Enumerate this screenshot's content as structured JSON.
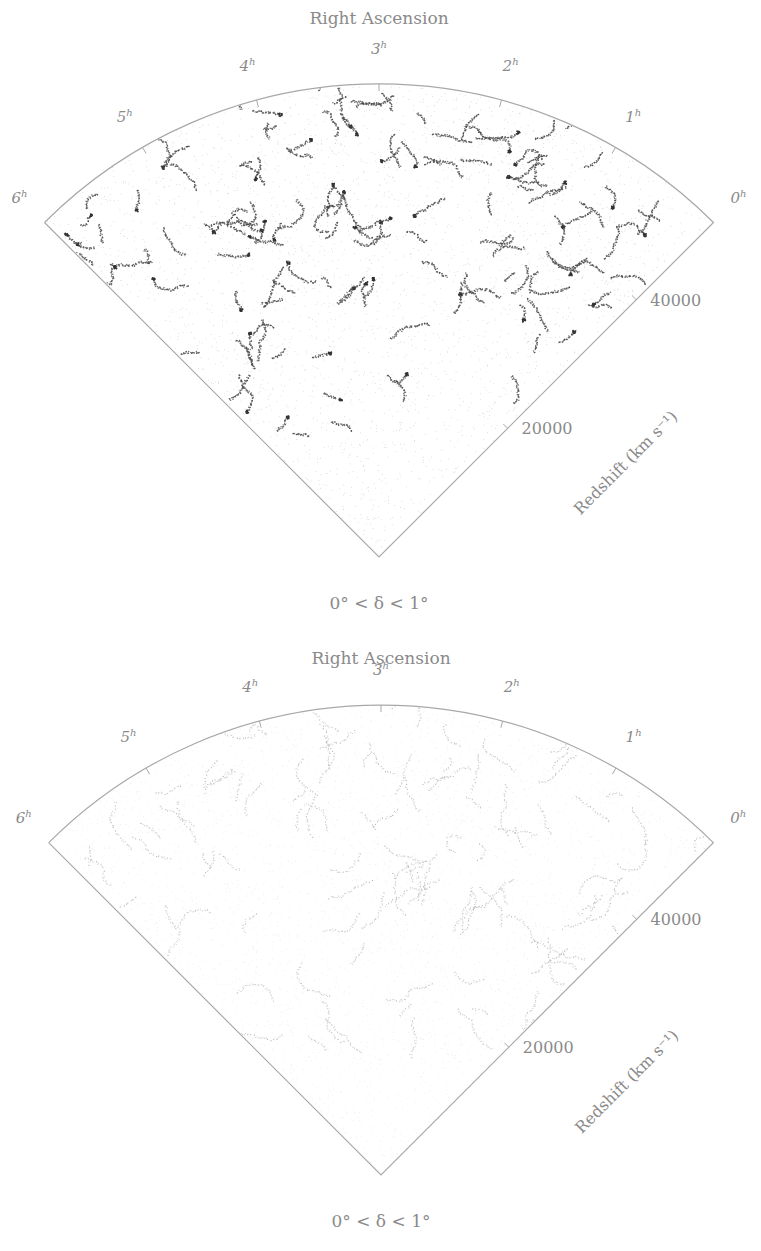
{
  "chart_data": [
    {
      "type": "scatter",
      "subtype": "wedge-diagram",
      "title": "Right Ascension",
      "ra_tick_labels": [
        "0h",
        "1h",
        "2h",
        "3h",
        "4h",
        "5h",
        "6h"
      ],
      "ra_ticks": [
        {
          "value": 0,
          "hour": "0",
          "sup": "h"
        },
        {
          "value": 1,
          "hour": "1",
          "sup": "h"
        },
        {
          "value": 2,
          "hour": "2",
          "sup": "h"
        },
        {
          "value": 3,
          "hour": "3",
          "sup": "h"
        },
        {
          "value": 4,
          "hour": "4",
          "sup": "h"
        },
        {
          "value": 5,
          "hour": "5",
          "sup": "h"
        },
        {
          "value": 6,
          "hour": "6",
          "sup": "h"
        }
      ],
      "ra_range_hours": [
        0,
        6
      ],
      "redshift_ticks": [
        20000,
        40000
      ],
      "redshift_tick_labels": [
        "20000",
        "40000"
      ],
      "redshift_range": [
        0,
        52000
      ],
      "radial_axis_label": "Redshift (km s⁻¹)",
      "declination_label": "0° < δ < 1°",
      "points_description": "dense galaxy distribution with pronounced filaments and clumps",
      "clustering": "strong"
    },
    {
      "type": "scatter",
      "subtype": "wedge-diagram",
      "title": "Right Ascension",
      "ra_tick_labels": [
        "0h",
        "1h",
        "2h",
        "3h",
        "4h",
        "5h",
        "6h"
      ],
      "ra_ticks": [
        {
          "value": 0,
          "hour": "0",
          "sup": "h"
        },
        {
          "value": 1,
          "hour": "1",
          "sup": "h"
        },
        {
          "value": 2,
          "hour": "2",
          "sup": "h"
        },
        {
          "value": 3,
          "hour": "3",
          "sup": "h"
        },
        {
          "value": 4,
          "hour": "4",
          "sup": "h"
        },
        {
          "value": 5,
          "hour": "5",
          "sup": "h"
        },
        {
          "value": 6,
          "hour": "6",
          "sup": "h"
        }
      ],
      "ra_range_hours": [
        0,
        6
      ],
      "redshift_ticks": [
        20000,
        40000
      ],
      "redshift_tick_labels": [
        "20000",
        "40000"
      ],
      "redshift_range": [
        0,
        52000
      ],
      "radial_axis_label": "Redshift (km s⁻¹)",
      "declination_label": "0° < δ < 1°",
      "points_description": "diffuse galaxy distribution with faint elongated filaments",
      "clustering": "weak"
    }
  ],
  "colors": {
    "text": "#8a8a8a",
    "frame": "#a8a8a8",
    "points_strong": "#444444",
    "points_weak": "#9a9a9a"
  }
}
